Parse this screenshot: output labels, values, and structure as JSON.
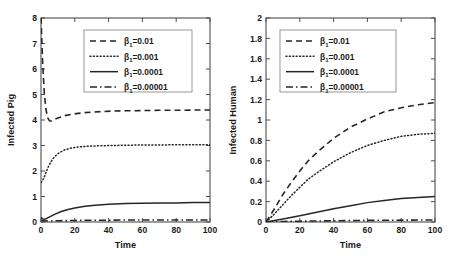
{
  "figure": {
    "background": "#ffffff",
    "line_color": "#262626",
    "axis_color": "#4d4d4d"
  },
  "chart_data": [
    {
      "type": "line",
      "panel": "left",
      "title": "",
      "xlabel": "Time",
      "ylabel": "Infected Pig",
      "xlim": [
        0,
        100
      ],
      "ylim": [
        0,
        8
      ],
      "xticks": [
        0,
        20,
        40,
        60,
        80,
        100
      ],
      "xticklabels": [
        "0",
        "20",
        "40",
        "60",
        "80",
        "100"
      ],
      "yticks": [
        0,
        1,
        2,
        3,
        4,
        5,
        6,
        7,
        8
      ],
      "yticklabels": [
        "0",
        "1",
        "2",
        "3",
        "4",
        "5",
        "6",
        "7",
        "8"
      ],
      "grid": false,
      "legend_position": "upper center",
      "series": [
        {
          "name": "β₁=0.01",
          "beta_symbol": "β",
          "beta_subscript": "1",
          "beta_value": "=0.01",
          "style": "dashed",
          "x": [
            0,
            1,
            2,
            3,
            4,
            5,
            6,
            8,
            10,
            14,
            18,
            22,
            26,
            30,
            36,
            42,
            50,
            60,
            70,
            80,
            90,
            100
          ],
          "y": [
            8.0,
            6.2,
            5.0,
            4.4,
            4.08,
            3.97,
            3.96,
            4.02,
            4.08,
            4.17,
            4.22,
            4.26,
            4.29,
            4.31,
            4.33,
            4.35,
            4.36,
            4.37,
            4.38,
            4.38,
            4.39,
            4.39
          ]
        },
        {
          "name": "β₁=0.001",
          "beta_symbol": "β",
          "beta_subscript": "1",
          "beta_value": "=0.001",
          "style": "dotted",
          "x": [
            0,
            1,
            2,
            3,
            4,
            6,
            8,
            10,
            14,
            18,
            22,
            26,
            30,
            36,
            42,
            50,
            60,
            70,
            80,
            90,
            100
          ],
          "y": [
            1.55,
            1.62,
            1.78,
            1.95,
            2.12,
            2.38,
            2.56,
            2.68,
            2.83,
            2.9,
            2.94,
            2.96,
            2.98,
            2.99,
            3.0,
            3.01,
            3.02,
            3.02,
            3.03,
            3.03,
            3.03
          ]
        },
        {
          "name": "β₁=0.0001",
          "beta_symbol": "β",
          "beta_subscript": "1",
          "beta_value": "=0.0001",
          "style": "solid",
          "x": [
            0,
            1,
            2,
            3,
            4,
            6,
            8,
            12,
            16,
            20,
            26,
            32,
            40,
            50,
            60,
            70,
            80,
            90,
            100
          ],
          "y": [
            0.18,
            0.12,
            0.11,
            0.13,
            0.16,
            0.23,
            0.3,
            0.41,
            0.49,
            0.55,
            0.62,
            0.66,
            0.7,
            0.73,
            0.74,
            0.75,
            0.75,
            0.76,
            0.76
          ]
        },
        {
          "name": "β₁=0.00001",
          "beta_symbol": "β",
          "beta_subscript": "1",
          "beta_value": "=0.00001",
          "style": "dashdot",
          "x": [
            0,
            5,
            10,
            20,
            30,
            40,
            50,
            60,
            70,
            80,
            90,
            100
          ],
          "y": [
            0.05,
            0.04,
            0.05,
            0.06,
            0.07,
            0.07,
            0.08,
            0.08,
            0.08,
            0.08,
            0.08,
            0.08
          ]
        }
      ]
    },
    {
      "type": "line",
      "panel": "right",
      "title": "",
      "xlabel": "Time",
      "ylabel": "Infected Human",
      "xlim": [
        0,
        100
      ],
      "ylim": [
        0,
        2
      ],
      "xticks": [
        0,
        20,
        40,
        60,
        80,
        100
      ],
      "xticklabels": [
        "0",
        "20",
        "40",
        "60",
        "80",
        "100"
      ],
      "yticks": [
        0,
        0.2,
        0.4,
        0.6,
        0.8,
        1,
        1.2,
        1.4,
        1.6,
        1.8,
        2
      ],
      "yticklabels": [
        "0",
        "0.2",
        "0.4",
        "0.6",
        "0.8",
        "1",
        "1.2",
        "1.4",
        "1.6",
        "1.8",
        "2"
      ],
      "grid": false,
      "legend_position": "upper left",
      "series": [
        {
          "name": "β₁=0.01",
          "beta_symbol": "β",
          "beta_subscript": "1",
          "beta_value": "=0.01",
          "style": "dashed",
          "x": [
            0,
            2,
            5,
            10,
            15,
            20,
            25,
            30,
            40,
            50,
            60,
            70,
            80,
            90,
            100
          ],
          "y": [
            0.0,
            0.05,
            0.13,
            0.27,
            0.39,
            0.5,
            0.6,
            0.68,
            0.82,
            0.93,
            1.01,
            1.08,
            1.12,
            1.15,
            1.17
          ]
        },
        {
          "name": "β₁=0.001",
          "beta_symbol": "β",
          "beta_subscript": "1",
          "beta_value": "=0.001",
          "style": "dotted",
          "x": [
            0,
            2,
            5,
            10,
            15,
            20,
            25,
            30,
            40,
            50,
            60,
            70,
            80,
            90,
            100
          ],
          "y": [
            0.0,
            0.03,
            0.08,
            0.17,
            0.26,
            0.34,
            0.42,
            0.48,
            0.59,
            0.68,
            0.75,
            0.8,
            0.84,
            0.86,
            0.87
          ]
        },
        {
          "name": "β₁=0.0001",
          "beta_symbol": "β",
          "beta_subscript": "1",
          "beta_value": "=0.0001",
          "style": "solid",
          "x": [
            0,
            5,
            10,
            20,
            30,
            40,
            50,
            60,
            70,
            80,
            90,
            100
          ],
          "y": [
            0.0,
            0.015,
            0.03,
            0.062,
            0.095,
            0.13,
            0.16,
            0.19,
            0.21,
            0.23,
            0.24,
            0.25
          ]
        },
        {
          "name": "β₁=0.00001",
          "beta_symbol": "β",
          "beta_subscript": "1",
          "beta_value": "=0.00001",
          "style": "dashdot",
          "x": [
            0,
            10,
            20,
            40,
            60,
            80,
            100
          ],
          "y": [
            0.0,
            0.005,
            0.008,
            0.012,
            0.016,
            0.018,
            0.02
          ]
        }
      ]
    }
  ]
}
